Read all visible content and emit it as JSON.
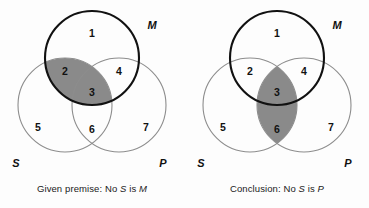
{
  "figure": {
    "background_color": "#fdfdfd",
    "shade_color": "#8a8a8a",
    "thin_stroke_color": "#8d8d8d",
    "bold_stroke_color": "#111111"
  },
  "panels": [
    {
      "id": "left",
      "caption_prefix": "Given premise: No ",
      "caption_subject": "S",
      "caption_middle": " is ",
      "caption_predicate": "M",
      "caption_full": "Given premise: No S is M",
      "shaded_regions": [
        "2",
        "3"
      ],
      "set_labels": {
        "M": "M",
        "S": "S",
        "P": "P"
      },
      "regions": [
        {
          "id": "1",
          "label": "1",
          "x": 92,
          "y": 34
        },
        {
          "id": "2",
          "label": "2",
          "x": 65,
          "y": 72
        },
        {
          "id": "3",
          "label": "3",
          "x": 92,
          "y": 93
        },
        {
          "id": "4",
          "label": "4",
          "x": 119,
          "y": 72
        },
        {
          "id": "5",
          "label": "5",
          "x": 38,
          "y": 128
        },
        {
          "id": "6",
          "label": "6",
          "x": 92,
          "y": 130
        },
        {
          "id": "7",
          "label": "7",
          "x": 146,
          "y": 128
        }
      ],
      "set_label_positions": {
        "M": {
          "x": 152,
          "y": 26
        },
        "S": {
          "x": 16,
          "y": 164
        },
        "P": {
          "x": 163,
          "y": 164
        }
      }
    },
    {
      "id": "right",
      "caption_prefix": "Conclusion: No ",
      "caption_subject": "S",
      "caption_middle": " is ",
      "caption_predicate": "P",
      "caption_full": "Conclusion: No S is P",
      "shaded_regions": [
        "3",
        "6"
      ],
      "set_labels": {
        "M": "M",
        "S": "S",
        "P": "P"
      },
      "regions": [
        {
          "id": "1",
          "label": "1",
          "x": 92,
          "y": 34
        },
        {
          "id": "2",
          "label": "2",
          "x": 65,
          "y": 72
        },
        {
          "id": "3",
          "label": "3",
          "x": 92,
          "y": 93
        },
        {
          "id": "4",
          "label": "4",
          "x": 119,
          "y": 72
        },
        {
          "id": "5",
          "label": "5",
          "x": 38,
          "y": 128
        },
        {
          "id": "6",
          "label": "6",
          "x": 92,
          "y": 130
        },
        {
          "id": "7",
          "label": "7",
          "x": 146,
          "y": 128
        }
      ],
      "set_label_positions": {
        "M": {
          "x": 152,
          "y": 26
        },
        "S": {
          "x": 16,
          "y": 164
        },
        "P": {
          "x": 163,
          "y": 164
        }
      }
    }
  ],
  "geometry": {
    "circle_M": {
      "cx": 92,
      "cy": 58,
      "r": 47
    },
    "circle_S": {
      "cx": 65,
      "cy": 105,
      "r": 47
    },
    "circle_P": {
      "cx": 119,
      "cy": 105,
      "r": 47
    }
  }
}
